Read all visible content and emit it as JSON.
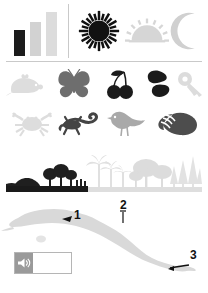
{
  "panel": {
    "chart_data": {
      "type": "bar",
      "title": "",
      "categories": [
        "1",
        "2",
        "3"
      ],
      "values": [
        26,
        34,
        44
      ],
      "colors": [
        "#1c1c1c",
        "#d2d2d2",
        "#dcdcdc"
      ],
      "xlabel": "",
      "ylabel": "",
      "ylim": [
        0,
        44
      ],
      "grid": false,
      "legend": false
    },
    "weather": [
      {
        "name": "sun-icon",
        "label": "Sun",
        "color": "#111111",
        "state": "selected"
      },
      {
        "name": "sunrise-icon",
        "label": "Sunrise",
        "color": "#d6d6d6",
        "state": "normal"
      },
      {
        "name": "moon-icon",
        "label": "Moon",
        "color": "#d0d0d0",
        "state": "normal"
      }
    ]
  },
  "icon_rows": [
    {
      "row": 1,
      "items": [
        {
          "name": "mouse-icon",
          "label": "Mouse",
          "color": "#dddddd"
        },
        {
          "name": "butterfly-icon",
          "label": "Butterfly",
          "color": "#6e6e6e"
        },
        {
          "name": "cherries-icon",
          "label": "Cherries",
          "color": "#1b1b1b"
        },
        {
          "name": "beans-icon",
          "label": "Beans",
          "color": "#1b1b1b"
        },
        {
          "name": "key-icon",
          "label": "Key",
          "color": "#dcdcdc"
        }
      ]
    },
    {
      "row": 2,
      "items": [
        {
          "name": "crab-icon",
          "label": "Crab",
          "color": "#dddddd"
        },
        {
          "name": "lizard-icon",
          "label": "Lizard",
          "color": "#444444"
        },
        {
          "name": "bird-icon",
          "label": "Bird",
          "color": "#a9a9a9"
        },
        {
          "name": "seashell-icon",
          "label": "Seashell",
          "color": "#4d4d4d"
        }
      ]
    }
  ],
  "landscape": {
    "label": "Vegetation panorama",
    "segments": [
      {
        "name": "near-shore-trees",
        "color": "#1f1f1f",
        "span_pct": 42
      },
      {
        "name": "palm-grove",
        "color": "#e0e0e0",
        "span_pct": 22
      },
      {
        "name": "broadleaf-trees",
        "color": "#dcdcdc",
        "span_pct": 20
      },
      {
        "name": "conifer-stand",
        "color": "#e2e2e2",
        "span_pct": 16
      }
    ],
    "ground": {
      "dark_color": "#1a1a1a",
      "light_color": "#dedede",
      "dark_span_pct": 42
    }
  },
  "map": {
    "name": "cuba-map",
    "label": "Cuba",
    "fill": "#d9d9d9",
    "markers": [
      {
        "id": "1",
        "label": "1",
        "x_pct": 36,
        "y_pct": 16
      },
      {
        "id": "2",
        "label": "2",
        "x_pct": 58,
        "y_pct": 4
      },
      {
        "id": "3",
        "label": "3",
        "x_pct": 92,
        "y_pct": 55
      }
    ]
  },
  "player": {
    "name": "audio-player",
    "speaker_icon": "speaker-icon",
    "button_color": "#9a9a9a",
    "track_color": "#ffffff",
    "progress_pct": 0
  }
}
